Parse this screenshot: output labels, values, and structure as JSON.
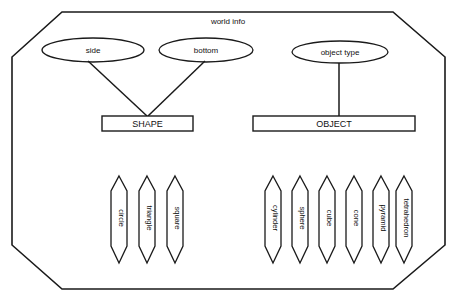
{
  "diagram": {
    "title": "world info",
    "boundary_shape": "octagon",
    "stroke_color": "#1a1a1a",
    "background_color": "#ffffff",
    "attributes": [
      {
        "label": "side",
        "cx": 93,
        "cy": 50,
        "rx": 51,
        "ry": 12,
        "connects_to": "SHAPE"
      },
      {
        "label": "bottom",
        "cx": 206,
        "cy": 50,
        "rx": 47,
        "ry": 12,
        "connects_to": "SHAPE"
      },
      {
        "label": "object type",
        "cx": 340,
        "cy": 52,
        "rx": 48,
        "ry": 11,
        "connects_to": "OBJECT"
      }
    ],
    "entities": [
      {
        "label": "SHAPE",
        "x": 102,
        "y": 116,
        "width": 91,
        "height": 15,
        "leaves": [
          {
            "label": "circle",
            "cx": 119
          },
          {
            "label": "triangle",
            "cx": 147
          },
          {
            "label": "square",
            "cx": 175
          }
        ]
      },
      {
        "label": "OBJECT",
        "x": 253,
        "y": 116,
        "width": 162,
        "height": 15,
        "leaves": [
          {
            "label": "cylinder",
            "cx": 273
          },
          {
            "label": "sphere",
            "cx": 300
          },
          {
            "label": "cube",
            "cx": 327
          },
          {
            "label": "cone",
            "cx": 354
          },
          {
            "label": "pyramid",
            "cx": 381
          },
          {
            "label": "tetrahedron",
            "cx": 404
          }
        ]
      }
    ],
    "leaf_geometry": {
      "top_point_y": 176,
      "shoulder_top_y": 191,
      "shoulder_bottom_y": 246,
      "bottom_point_y": 263,
      "half_width": 8
    }
  }
}
